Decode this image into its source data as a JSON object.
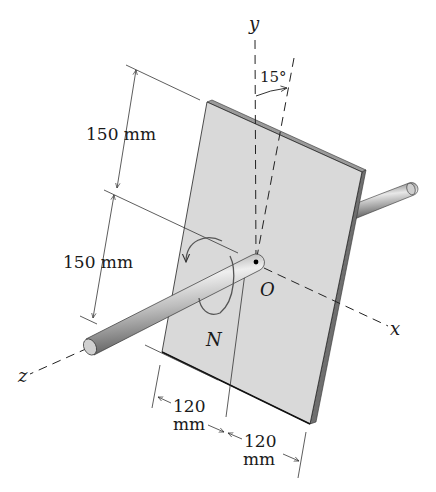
{
  "figure": {
    "axes": {
      "x_label": "x",
      "y_label": "y",
      "z_label": "z",
      "origin_label": "O"
    },
    "angle_label": "15°",
    "moment_label": "N",
    "dimensions": {
      "upper_height": "150 mm",
      "lower_height": "150 mm",
      "left_width_value": "120",
      "left_width_unit": "mm",
      "right_width_value": "120",
      "right_width_unit": "mm"
    },
    "colors": {
      "plate_face": "#d9d9d9",
      "plate_edge": "#7a7a7a",
      "line": "#222222",
      "rod": "#b5b5b5"
    }
  }
}
